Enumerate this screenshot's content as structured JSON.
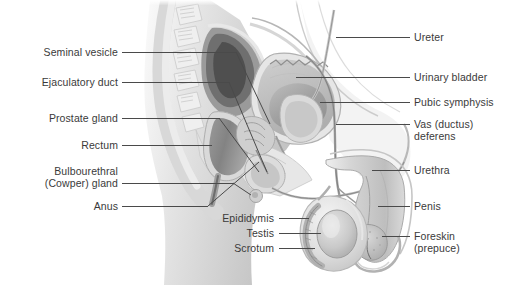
{
  "figure": {
    "background_color": "#ffffff",
    "label_color": "#3a3a3a",
    "leader_color": "#4a4a4a",
    "width": 511,
    "height": 285
  },
  "labels_left": [
    {
      "id": "seminal-vesicle",
      "text": "Seminal vesicle"
    },
    {
      "id": "ejaculatory-duct",
      "text": "Ejaculatory duct"
    },
    {
      "id": "prostate-gland",
      "text": "Prostate gland"
    },
    {
      "id": "rectum",
      "text": "Rectum"
    },
    {
      "id": "bulbourethral-gland-line1",
      "text": "Bulbourethral"
    },
    {
      "id": "bulbourethral-gland-line2",
      "text": "(Cowper) gland"
    },
    {
      "id": "anus",
      "text": "Anus"
    }
  ],
  "labels_right": [
    {
      "id": "ureter",
      "text": "Ureter"
    },
    {
      "id": "urinary-bladder",
      "text": "Urinary bladder"
    },
    {
      "id": "pubic-symphysis",
      "text": "Pubic symphysis"
    },
    {
      "id": "vas-deferens-line1",
      "text": "Vas (ductus)"
    },
    {
      "id": "vas-deferens-line2",
      "text": "deferens"
    },
    {
      "id": "urethra",
      "text": "Urethra"
    },
    {
      "id": "penis",
      "text": "Penis"
    },
    {
      "id": "foreskin-line1",
      "text": "Foreskin"
    },
    {
      "id": "foreskin-line2",
      "text": "(prepuce)"
    }
  ],
  "labels_bottom": [
    {
      "id": "epididymis",
      "text": "Epididymis"
    },
    {
      "id": "testis",
      "text": "Testis"
    },
    {
      "id": "scrotum",
      "text": "Scrotum"
    }
  ]
}
